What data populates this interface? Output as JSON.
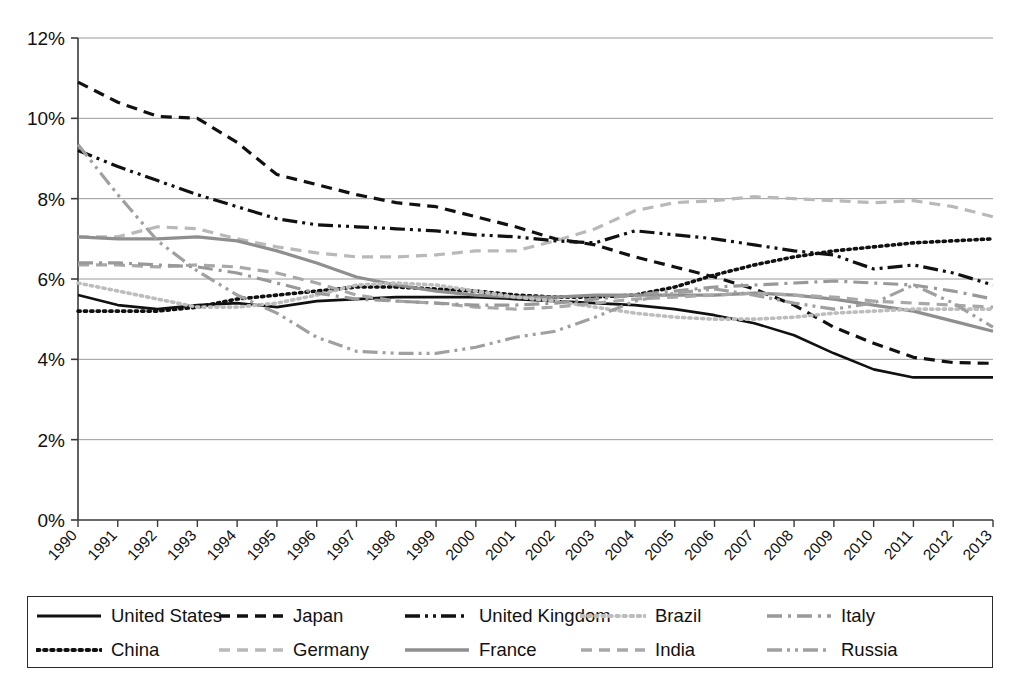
{
  "chart_data": {
    "type": "line",
    "title": "",
    "xlabel": "",
    "ylabel": "",
    "x": [
      "1990",
      "1991",
      "1992",
      "1993",
      "1994",
      "1995",
      "1996",
      "1997",
      "1998",
      "1999",
      "2000",
      "2001",
      "2002",
      "2003",
      "2004",
      "2005",
      "2006",
      "2007",
      "2008",
      "2009",
      "2010",
      "2011",
      "2012",
      "2013"
    ],
    "ylim": [
      0,
      12
    ],
    "ytick_labels": [
      "0%",
      "2%",
      "4%",
      "6%",
      "8%",
      "10%",
      "12%"
    ],
    "ytick_values": [
      0,
      2,
      4,
      6,
      8,
      10,
      12
    ],
    "y_unit": "%",
    "grid": "horizontal",
    "legend_position": "bottom",
    "series": [
      {
        "name": "United States",
        "color": "#111111",
        "dash": "solid",
        "width": 2.6,
        "values": [
          5.6,
          5.35,
          5.25,
          5.35,
          5.4,
          5.3,
          5.45,
          5.5,
          5.55,
          5.55,
          5.55,
          5.5,
          5.45,
          5.4,
          5.35,
          5.25,
          5.1,
          4.9,
          4.6,
          4.15,
          3.75,
          3.55,
          3.55,
          3.55
        ]
      },
      {
        "name": "China",
        "color": "#111111",
        "dash": "dotted",
        "width": 3.6,
        "values": [
          5.2,
          5.2,
          5.2,
          5.3,
          5.5,
          5.6,
          5.7,
          5.8,
          5.8,
          5.75,
          5.7,
          5.6,
          5.55,
          5.55,
          5.6,
          5.8,
          6.1,
          6.35,
          6.55,
          6.7,
          6.8,
          6.9,
          6.95,
          7.0
        ]
      },
      {
        "name": "Japan",
        "color": "#111111",
        "dash": "dashed",
        "width": 3.2,
        "values": [
          10.9,
          10.4,
          10.05,
          10.0,
          9.4,
          8.6,
          8.35,
          8.1,
          7.9,
          7.8,
          7.55,
          7.3,
          7.0,
          6.85,
          6.55,
          6.3,
          6.05,
          5.75,
          5.35,
          4.8,
          4.4,
          4.05,
          3.92,
          3.9
        ]
      },
      {
        "name": "Germany",
        "color": "#b9b9b9",
        "dash": "dashed",
        "width": 3.2,
        "values": [
          7.05,
          7.05,
          7.3,
          7.25,
          7.0,
          6.8,
          6.65,
          6.55,
          6.55,
          6.6,
          6.7,
          6.7,
          6.95,
          7.25,
          7.7,
          7.9,
          7.95,
          8.05,
          8.0,
          7.95,
          7.9,
          7.95,
          7.8,
          7.55
        ]
      },
      {
        "name": "United Kingdom",
        "color": "#111111",
        "dash": "dash-dot-dot",
        "width": 3.2,
        "values": [
          9.2,
          8.8,
          8.45,
          8.1,
          7.8,
          7.5,
          7.35,
          7.3,
          7.25,
          7.2,
          7.1,
          7.05,
          6.95,
          6.9,
          7.2,
          7.1,
          7.0,
          6.85,
          6.7,
          6.6,
          6.25,
          6.35,
          6.15,
          5.85
        ]
      },
      {
        "name": "France",
        "color": "#8f8f8f",
        "dash": "solid",
        "width": 3.2,
        "values": [
          7.05,
          7.0,
          7.0,
          7.05,
          6.95,
          6.7,
          6.4,
          6.05,
          5.85,
          5.7,
          5.6,
          5.55,
          5.55,
          5.6,
          5.6,
          5.6,
          5.6,
          5.65,
          5.6,
          5.5,
          5.35,
          5.2,
          4.95,
          4.7
        ]
      },
      {
        "name": "Brazil",
        "color": "#bdbdbd",
        "dash": "dotted",
        "width": 3.6,
        "values": [
          5.9,
          5.7,
          5.5,
          5.3,
          5.3,
          5.4,
          5.6,
          5.85,
          5.9,
          5.85,
          5.7,
          5.55,
          5.45,
          5.3,
          5.15,
          5.05,
          5.0,
          5.0,
          5.05,
          5.15,
          5.2,
          5.25,
          5.25,
          5.25
        ]
      },
      {
        "name": "India",
        "color": "#a8a8a8",
        "dash": "dashed",
        "width": 3.2,
        "values": [
          6.35,
          6.35,
          6.3,
          6.35,
          6.3,
          6.15,
          5.9,
          5.6,
          5.45,
          5.4,
          5.3,
          5.25,
          5.3,
          5.4,
          5.5,
          5.55,
          5.6,
          5.65,
          5.6,
          5.55,
          5.45,
          5.4,
          5.35,
          5.3
        ]
      },
      {
        "name": "Italy",
        "color": "#999999",
        "dash": "dash-dot",
        "width": 3.2,
        "values": [
          6.4,
          6.4,
          6.35,
          6.3,
          6.15,
          5.9,
          5.65,
          5.5,
          5.45,
          5.4,
          5.35,
          5.35,
          5.4,
          5.5,
          5.6,
          5.7,
          5.8,
          5.85,
          5.9,
          5.95,
          5.9,
          5.85,
          5.7,
          5.5
        ]
      },
      {
        "name": "Russia",
        "color": "#a0a0a0",
        "dash": "dash-dot-dot",
        "width": 3.2,
        "values": [
          9.35,
          8.1,
          6.95,
          6.2,
          5.6,
          5.15,
          4.55,
          4.2,
          4.15,
          4.15,
          4.3,
          4.55,
          4.7,
          5.05,
          5.45,
          5.65,
          5.75,
          5.6,
          5.4,
          5.25,
          5.4,
          5.85,
          5.4,
          4.8
        ]
      }
    ]
  },
  "legend": {
    "items": [
      {
        "label": "United States",
        "swatch": "line-solid-black"
      },
      {
        "label": "China",
        "swatch": "line-dotted-black"
      },
      {
        "label": "Japan",
        "swatch": "line-dashed-black"
      },
      {
        "label": "Germany",
        "swatch": "line-dashed-lightgray"
      },
      {
        "label": "United Kingdom",
        "swatch": "line-dashdotdot-black"
      },
      {
        "label": "France",
        "swatch": "line-solid-gray"
      },
      {
        "label": "Brazil",
        "swatch": "line-dotted-gray"
      },
      {
        "label": "India",
        "swatch": "line-dashed-gray"
      },
      {
        "label": "Italy",
        "swatch": "line-dashdot-gray"
      },
      {
        "label": "Russia",
        "swatch": "line-dashdotdot-gray"
      }
    ]
  }
}
